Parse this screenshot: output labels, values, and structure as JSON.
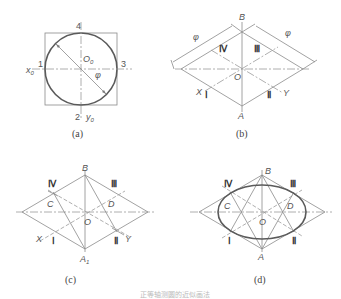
{
  "figure": {
    "caption": "正等轴测圆的近似画法",
    "panels": [
      {
        "id": "a",
        "label": "(a)",
        "labels": {
          "top": "4",
          "left": "1",
          "right": "3",
          "bottom": "2",
          "x_axis": "x",
          "x_sub": "0",
          "y_axis": "y",
          "y_sub": "0",
          "center": "O",
          "center_sub": "0",
          "diameter": "φ"
        }
      },
      {
        "id": "b",
        "label": "(b)",
        "labels": {
          "top": "B",
          "bottom": "A",
          "center": "O",
          "p4": "Ⅳ",
          "p3": "Ⅲ",
          "p1": "Ⅰ",
          "p2": "Ⅱ",
          "x_axis": "X",
          "y_axis": "Y",
          "dim_left": "φ",
          "dim_right": "φ"
        }
      },
      {
        "id": "c",
        "label": "(c)",
        "labels": {
          "top": "B",
          "bottom": "A",
          "bottom_sub": "1",
          "center": "O",
          "left_center": "C",
          "right_center": "D",
          "p4": "Ⅳ",
          "p3": "Ⅲ",
          "p1": "Ⅰ",
          "p2": "Ⅱ",
          "x_axis": "X",
          "y_axis": "Y"
        }
      },
      {
        "id": "d",
        "label": "(d)",
        "labels": {
          "top": "B",
          "bottom": "A",
          "center": "O",
          "left_center": "C",
          "right_center": "D",
          "p4": "Ⅳ",
          "p3": "Ⅲ",
          "p1": "Ⅰ",
          "p2": "Ⅱ"
        }
      }
    ]
  }
}
